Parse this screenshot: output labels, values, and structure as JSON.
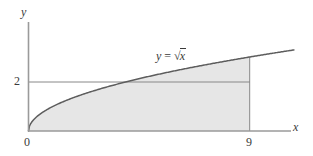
{
  "figure": {
    "background_color": "#ffffff",
    "shade_color": "#e6e6e6",
    "line_color": "#7a7a7a",
    "curve_color": "#6b6b6b",
    "text_color": "#3a3a3a"
  },
  "axes": {
    "y_axis_label": "y",
    "x_axis_label": "x",
    "origin_label": "0"
  },
  "ticks": {
    "x": [
      {
        "value": 9,
        "label": "9"
      }
    ],
    "y": [
      {
        "value": 2,
        "label": "2"
      }
    ]
  },
  "annotations": {
    "curve_equation": {
      "lhs": "y",
      "equals": "=",
      "radical": "√",
      "radicand": "x",
      "full_text": "y = √x"
    }
  },
  "chart_data": {
    "type": "line",
    "xlabel": "x",
    "ylabel": "y",
    "xlim": [
      0,
      10.8
    ],
    "ylim": [
      0,
      4.45
    ],
    "grid": false,
    "legend": null,
    "series": [
      {
        "name": "y = √x",
        "equation": "y = sqrt(x)",
        "x": [
          0,
          0.25,
          0.5,
          1,
          1.5,
          2,
          2.5,
          3,
          3.5,
          4,
          4.5,
          5,
          5.5,
          6,
          6.5,
          7,
          7.5,
          8,
          8.5,
          9,
          9.5,
          10,
          10.15
        ],
        "y": [
          0,
          0.5,
          0.707,
          1,
          1.225,
          1.414,
          1.581,
          1.732,
          1.871,
          2,
          2.121,
          2.236,
          2.345,
          2.449,
          2.55,
          2.646,
          2.739,
          2.828,
          2.915,
          3,
          3.082,
          3.162,
          3.186
        ]
      },
      {
        "name": "horizontal line y = 2",
        "type": "hline",
        "y_value": 2,
        "x_from": 0,
        "x_to": 9
      },
      {
        "name": "vertical line x = 9",
        "type": "vline",
        "x_value": 9,
        "y_from": 0,
        "y_to": 3
      }
    ],
    "shaded_region": {
      "description": "Area under y = √x between x = 0 and x = 9",
      "x_from": 0,
      "x_to": 9,
      "upper_curve": "y = √x",
      "lower_curve": "y = 0",
      "fill": "#e6e6e6"
    },
    "tick_labels": {
      "x": [
        "0",
        "9"
      ],
      "y": [
        "2"
      ]
    },
    "annotations": [
      {
        "text": "y = √x",
        "x": 5.4,
        "y": 3.55
      }
    ]
  }
}
